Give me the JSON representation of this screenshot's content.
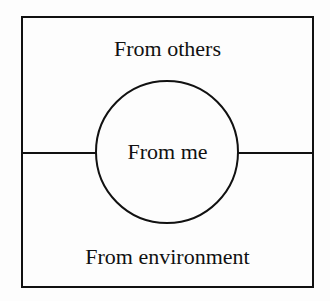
{
  "diagram": {
    "labels": {
      "top": "From others",
      "center": "From me",
      "bottom": "From environment"
    }
  }
}
